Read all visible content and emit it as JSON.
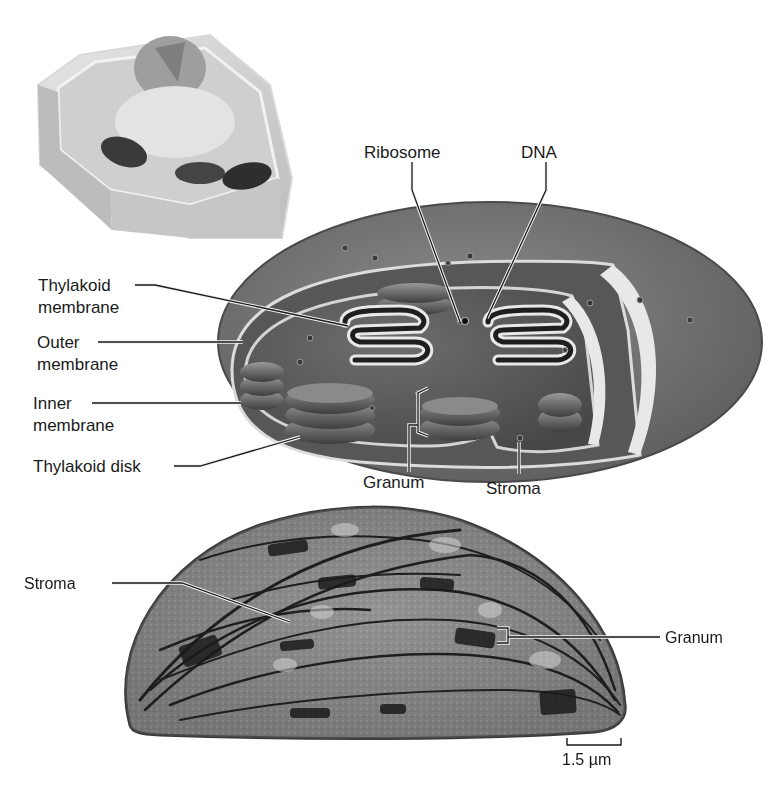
{
  "figure": {
    "panels": [
      {
        "id": "cell-inset",
        "description": "Plant cell with chloroplasts"
      },
      {
        "id": "cutaway",
        "description": "Cutaway illustration of a chloroplast"
      },
      {
        "id": "micrograph",
        "description": "Electron micrograph of a chloroplast"
      }
    ]
  },
  "labels": {
    "ribosome": "Ribosome",
    "dna": "DNA",
    "thylakoid_membrane_1": "Thylakoid",
    "thylakoid_membrane_2": "membrane",
    "outer_membrane_1": "Outer",
    "outer_membrane_2": "membrane",
    "inner_membrane_1": "Inner",
    "inner_membrane_2": "membrane",
    "thylakoid_disk": "Thylakoid disk",
    "granum": "Granum",
    "stroma": "Stroma"
  },
  "micrograph": {
    "stroma": "Stroma",
    "granum": "Granum",
    "scale_bar": "1.5 µm"
  },
  "colors": {
    "background": "#ffffff",
    "outer_shell": "#7a7a7a",
    "stroma_fill": "#5e5e5e",
    "grana": "#6f6f6f",
    "micrograph": "#8a8a8a",
    "text": "#1a1a1a"
  }
}
